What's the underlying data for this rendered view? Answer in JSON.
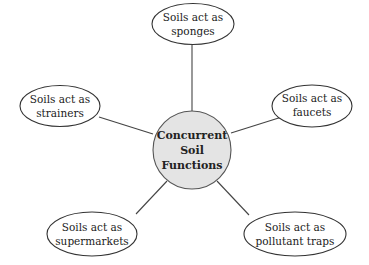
{
  "diagram": {
    "type": "hub-and-spoke",
    "hub": {
      "lines": [
        "Concurrent",
        "Soil",
        "Functions"
      ],
      "fill": "#e4e4e4"
    },
    "nodes": [
      {
        "id": "sponges",
        "position": "top",
        "lines": [
          "Soils act as",
          "sponges"
        ]
      },
      {
        "id": "strainers",
        "position": "left",
        "lines": [
          "Soils act as",
          "strainers"
        ]
      },
      {
        "id": "faucets",
        "position": "right",
        "lines": [
          "Soils act as",
          "faucets"
        ]
      },
      {
        "id": "supermarkets",
        "position": "bottom-left",
        "lines": [
          "Soils act as",
          "supermarkets"
        ]
      },
      {
        "id": "pollutant-traps",
        "position": "bottom-right",
        "lines": [
          "Soils act as",
          "pollutant traps"
        ]
      }
    ]
  }
}
